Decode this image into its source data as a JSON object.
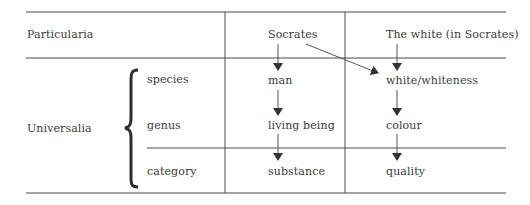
{
  "diagram": {
    "rows": {
      "particularia_label": "Particularia",
      "universalia_label": "Universalia"
    },
    "levels": [
      "species",
      "genus",
      "category"
    ],
    "columns": [
      {
        "header": "Socrates",
        "chain": [
          "man",
          "living being",
          "substance"
        ]
      },
      {
        "header": "The white (in Socrates)",
        "chain": [
          "white/whiteness",
          "colour",
          "quality"
        ]
      }
    ],
    "cross_arrow": {
      "from": "Socrates",
      "to": "white/whiteness"
    },
    "colors": {
      "line": "#4a4a4a",
      "text": "#3a3a3a"
    }
  }
}
